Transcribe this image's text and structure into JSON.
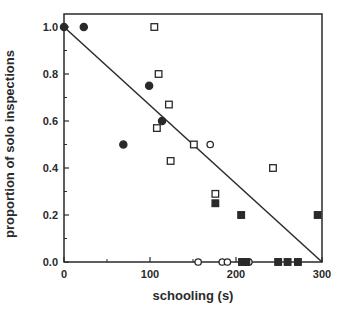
{
  "chart_data": {
    "type": "scatter",
    "title": "",
    "xlabel": "schooling (s)",
    "ylabel": "proportion of solo inspections",
    "xlim": [
      0,
      300
    ],
    "ylim": [
      0,
      1.0
    ],
    "x_ticks": [
      0,
      100,
      200,
      300
    ],
    "x_tick_labels": [
      "0",
      "100",
      "200",
      "300"
    ],
    "x_minor_ticks": [
      50,
      150,
      250
    ],
    "y_ticks": [
      0.0,
      0.2,
      0.4,
      0.6,
      0.8,
      1.0
    ],
    "y_tick_labels": [
      "0.0",
      "0.2",
      "0.4",
      "0.6",
      "0.8",
      "1.0"
    ],
    "y_minor_ticks": [
      0.1,
      0.3,
      0.5,
      0.7,
      0.9
    ],
    "grid": false,
    "legend": null,
    "series": [
      {
        "name": "filled-circles",
        "marker": "circle",
        "filled": true,
        "points": [
          [
            0,
            1.0
          ],
          [
            23,
            1.0
          ],
          [
            99,
            0.75
          ],
          [
            114,
            0.6
          ],
          [
            69,
            0.5
          ]
        ]
      },
      {
        "name": "open-squares",
        "marker": "square",
        "filled": false,
        "points": [
          [
            105,
            1.0
          ],
          [
            110,
            0.8
          ],
          [
            122,
            0.67
          ],
          [
            108,
            0.57
          ],
          [
            151,
            0.5
          ],
          [
            124,
            0.43
          ],
          [
            176,
            0.29
          ],
          [
            243,
            0.4
          ]
        ]
      },
      {
        "name": "open-circles",
        "marker": "circle",
        "filled": false,
        "points": [
          [
            170,
            0.5
          ],
          [
            156,
            0.0
          ],
          [
            184,
            0.0
          ],
          [
            190,
            0.0
          ],
          [
            215,
            0.0
          ]
        ]
      },
      {
        "name": "filled-squares",
        "marker": "square",
        "filled": true,
        "points": [
          [
            176,
            0.25
          ],
          [
            206,
            0.2
          ],
          [
            295,
            0.2
          ],
          [
            207,
            0.0
          ],
          [
            212,
            0.0
          ],
          [
            249,
            0.0
          ],
          [
            260,
            0.0
          ],
          [
            272,
            0.0
          ]
        ]
      }
    ],
    "regression_line": {
      "from": [
        0,
        1.0
      ],
      "to": [
        300,
        0.0
      ]
    }
  }
}
